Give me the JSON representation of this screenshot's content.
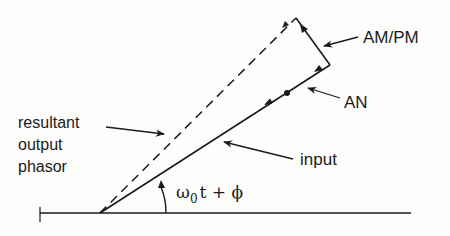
{
  "diagram": {
    "type": "phasor",
    "colors": {
      "ink": "#1a1a1a",
      "background": "#fdfdfb"
    },
    "labels": {
      "am_pm": "AM/PM",
      "an": "AN",
      "resultant_line1": "resultant",
      "resultant_line2": "output",
      "resultant_line3": "phasor",
      "input": "input",
      "angle_omega": "ω",
      "angle_sub": "0",
      "angle_rest": "t + ϕ"
    }
  }
}
